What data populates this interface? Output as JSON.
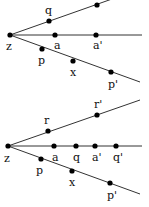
{
  "diagrams": [
    {
      "id": "top",
      "origin": {
        "label": "z",
        "x": 10,
        "y": 35,
        "lx": 6,
        "ly": 50
      },
      "rays": [
        {
          "name": "upper",
          "x1": 10,
          "y1": 35,
          "x2": 112,
          "y2": -1
        },
        {
          "name": "middle",
          "x1": 10,
          "y1": 35,
          "x2": 142,
          "y2": 35
        },
        {
          "name": "lower",
          "x1": 10,
          "y1": 35,
          "x2": 140,
          "y2": 82
        }
      ],
      "points": [
        {
          "label": "q",
          "x": 49,
          "y": 21,
          "lx": 45,
          "ly": 14
        },
        {
          "label": "",
          "x": 97,
          "y": 5,
          "lx": 0,
          "ly": 0
        },
        {
          "label": "a",
          "x": 55,
          "y": 35,
          "lx": 54,
          "ly": 49
        },
        {
          "label": "a'",
          "x": 96,
          "y": 35,
          "lx": 93,
          "ly": 49
        },
        {
          "label": "p",
          "x": 42,
          "y": 49,
          "lx": 38,
          "ly": 64
        },
        {
          "label": "x",
          "x": 73,
          "y": 61,
          "lx": 70,
          "ly": 76
        },
        {
          "label": "p'",
          "x": 111,
          "y": 72,
          "lx": 108,
          "ly": 88
        }
      ]
    },
    {
      "id": "bottom",
      "origin": {
        "label": "z",
        "x": 8,
        "y": 146,
        "lx": 4,
        "ly": 162
      },
      "rays": [
        {
          "name": "upper",
          "x1": 8,
          "y1": 146,
          "x2": 140,
          "y2": 100
        },
        {
          "name": "middle",
          "x1": 8,
          "y1": 146,
          "x2": 142,
          "y2": 146
        },
        {
          "name": "lower",
          "x1": 8,
          "y1": 146,
          "x2": 140,
          "y2": 194
        }
      ],
      "points": [
        {
          "label": "r",
          "x": 48,
          "y": 131,
          "lx": 44,
          "ly": 124
        },
        {
          "label": "r'",
          "x": 97,
          "y": 115,
          "lx": 94,
          "ly": 108
        },
        {
          "label": "a",
          "x": 54,
          "y": 146,
          "lx": 52,
          "ly": 161
        },
        {
          "label": "q",
          "x": 76,
          "y": 146,
          "lx": 73,
          "ly": 161
        },
        {
          "label": "a'",
          "x": 95,
          "y": 146,
          "lx": 92,
          "ly": 161
        },
        {
          "label": "q'",
          "x": 116,
          "y": 146,
          "lx": 113,
          "ly": 161
        },
        {
          "label": "p",
          "x": 41,
          "y": 159,
          "lx": 36,
          "ly": 174
        },
        {
          "label": "x",
          "x": 72,
          "y": 171,
          "lx": 69,
          "ly": 186
        },
        {
          "label": "p'",
          "x": 110,
          "y": 183,
          "lx": 107,
          "ly": 199
        }
      ]
    }
  ],
  "style": {
    "line_color": "#333333",
    "dot_color": "#000000",
    "dot_radius": 2.6
  }
}
